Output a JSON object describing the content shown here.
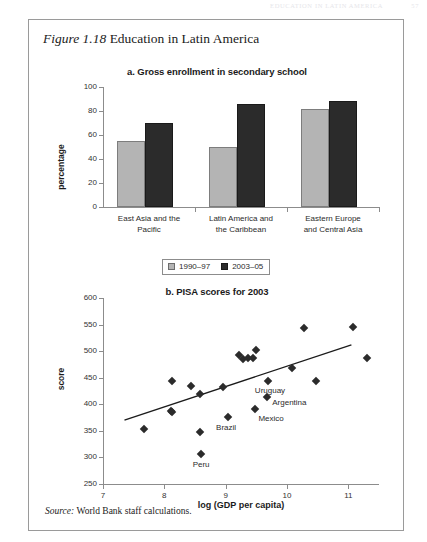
{
  "page": {
    "running_head": "EDUCATION IN LATIN AMERICA",
    "folio": "57"
  },
  "figure": {
    "number_label": "Figure 1.18",
    "title": "Education in Latin America",
    "source_label": "Source:",
    "source_text": "World Bank staff calculations."
  },
  "legend": {
    "items": [
      {
        "label": "1990–97",
        "color": "#b4b4b4"
      },
      {
        "label": "2003–05",
        "color": "#2b2b2b"
      }
    ]
  },
  "chart_data": [
    {
      "type": "bar",
      "panel": "a",
      "title": "a. Gross enrollment in secondary school",
      "xlabel": "",
      "ylabel": "percentage",
      "ylim": [
        0,
        100
      ],
      "yticks": [
        0,
        20,
        40,
        60,
        80,
        100
      ],
      "grid": false,
      "legend_position": "bottom-center",
      "categories": [
        "East Asia and the\nPacific",
        "Latin America and\nthe Caribbean",
        "Eastern Europe\nand Central Asia"
      ],
      "category_lines": [
        [
          "East Asia and the",
          "Pacific"
        ],
        [
          "Latin America and",
          "the Caribbean"
        ],
        [
          "Eastern Europe",
          "and Central Asia"
        ]
      ],
      "series": [
        {
          "name": "1990–97",
          "color": "#b4b4b4",
          "values": [
            55,
            50,
            82
          ]
        },
        {
          "name": "2003–05",
          "color": "#2b2b2b",
          "values": [
            70,
            86,
            88
          ]
        }
      ]
    },
    {
      "type": "scatter",
      "panel": "b",
      "title": "b. PISA scores for 2003",
      "xlabel": "log (GDP per capita)",
      "ylabel": "score",
      "xlim": [
        7,
        11.5
      ],
      "ylim": [
        250,
        600
      ],
      "xticks": [
        7,
        8,
        9,
        10,
        11
      ],
      "yticks": [
        250,
        300,
        350,
        400,
        450,
        500,
        550,
        600
      ],
      "grid": false,
      "points": [
        {
          "x": 7.67,
          "y": 353,
          "label": ""
        },
        {
          "x": 8.11,
          "y": 388,
          "label": ""
        },
        {
          "x": 8.12,
          "y": 385,
          "label": ""
        },
        {
          "x": 8.13,
          "y": 443,
          "label": ""
        },
        {
          "x": 8.43,
          "y": 435,
          "label": ""
        },
        {
          "x": 8.58,
          "y": 419,
          "label": ""
        },
        {
          "x": 8.58,
          "y": 348,
          "label": ""
        },
        {
          "x": 8.6,
          "y": 306,
          "label": "Peru"
        },
        {
          "x": 8.95,
          "y": 432,
          "label": ""
        },
        {
          "x": 9.04,
          "y": 377,
          "label": "Brazil"
        },
        {
          "x": 9.22,
          "y": 493,
          "label": ""
        },
        {
          "x": 9.28,
          "y": 485,
          "label": ""
        },
        {
          "x": 9.37,
          "y": 487,
          "label": ""
        },
        {
          "x": 9.44,
          "y": 487,
          "label": ""
        },
        {
          "x": 9.5,
          "y": 503,
          "label": ""
        },
        {
          "x": 9.48,
          "y": 392,
          "label": "Mexico"
        },
        {
          "x": 9.69,
          "y": 443,
          "label": "Uruguay"
        },
        {
          "x": 9.68,
          "y": 414,
          "label": "Argentina"
        },
        {
          "x": 10.08,
          "y": 469,
          "label": ""
        },
        {
          "x": 10.28,
          "y": 543,
          "label": ""
        },
        {
          "x": 10.48,
          "y": 443,
          "label": ""
        },
        {
          "x": 11.08,
          "y": 545,
          "label": ""
        },
        {
          "x": 11.3,
          "y": 488,
          "label": ""
        }
      ],
      "trendline": {
        "x0": 7.35,
        "y0": 370,
        "x1": 11.05,
        "y1": 512
      }
    }
  ]
}
